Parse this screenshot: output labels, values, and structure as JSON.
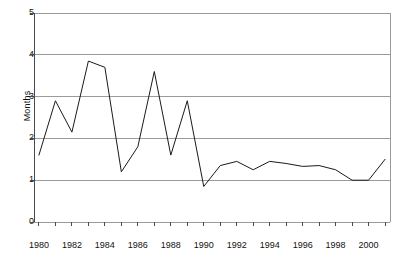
{
  "chart_data": {
    "type": "line",
    "title": "",
    "xlabel": "",
    "ylabel": "Months",
    "xlim": [
      1979.7,
      2001.3
    ],
    "ylim": [
      0,
      5
    ],
    "grid": true,
    "legend": false,
    "series_color": "#1a1a1a",
    "grid_color": "#9a9a9a",
    "x": [
      1980,
      1981,
      1982,
      1983,
      1984,
      1985,
      1986,
      1987,
      1988,
      1989,
      1990,
      1991,
      1992,
      1993,
      1994,
      1995,
      1996,
      1997,
      1998,
      1999,
      2000,
      2001
    ],
    "values": [
      1.6,
      2.9,
      2.15,
      3.85,
      3.7,
      1.2,
      1.8,
      3.6,
      1.6,
      2.9,
      0.85,
      1.35,
      1.45,
      1.25,
      1.45,
      1.4,
      1.33,
      1.35,
      1.25,
      1.0,
      1.0,
      1.5
    ],
    "ytick_values": [
      0,
      1,
      2,
      3,
      4,
      5
    ],
    "ytick_labels": [
      "0",
      "1",
      "2",
      "3",
      "4",
      "5"
    ],
    "xtick_values": [
      1980,
      1982,
      1984,
      1986,
      1988,
      1990,
      1992,
      1994,
      1996,
      1998,
      2000
    ],
    "xtick_labels": [
      "1980",
      "1982",
      "1984",
      "1986",
      "1988",
      "1990",
      "1992",
      "1994",
      "1996",
      "1998",
      "2000"
    ],
    "xtick_minor_values": [
      1981,
      1983,
      1985,
      1987,
      1989,
      1991,
      1993,
      1995,
      1997,
      1999,
      2001
    ]
  }
}
